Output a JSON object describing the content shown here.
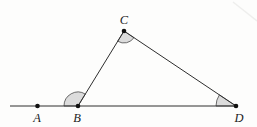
{
  "figure": {
    "background": "#fdfdfc",
    "line_color": "#2e2e2e",
    "line_width": 1,
    "wedge_fill": "#dcdcdc",
    "wedge_stroke": "#4a4a4a",
    "wedge_stroke_width": 0.8,
    "dot_color": "#111111",
    "dot_radius": 2.3,
    "label_color": "#1c1c1c",
    "points": [
      {
        "name": "A",
        "x": 37.5,
        "y": 106,
        "label": "A",
        "lx": 37,
        "ly": 122,
        "on_line": true
      },
      {
        "name": "B",
        "x": 78,
        "y": 106,
        "label": "B",
        "lx": 77,
        "ly": 122,
        "on_line": true
      },
      {
        "name": "C",
        "x": 124,
        "y": 31,
        "label": "C",
        "lx": 124,
        "ly": 24,
        "on_line": false
      },
      {
        "name": "D",
        "x": 236,
        "y": 106,
        "label": "D",
        "lx": 239,
        "ly": 122,
        "on_line": true
      }
    ],
    "base_line": {
      "x1": 10,
      "y1": 106,
      "x2": 236,
      "y2": 106
    },
    "segments": [
      {
        "from": "B",
        "to": "C"
      },
      {
        "from": "C",
        "to": "D"
      }
    ],
    "angle_marks": [
      {
        "at": "B",
        "r": 14,
        "from": 180,
        "to": 301.5,
        "note": "exterior angle ABC"
      },
      {
        "at": "C",
        "r": 12,
        "from": 33.8,
        "to": 121.5,
        "note": "interior angle BCD"
      },
      {
        "at": "D",
        "r": 20,
        "from": 180,
        "to": 213.8,
        "note": "interior angle CDB"
      }
    ],
    "corner_artifact": {
      "x1": 233,
      "y1": 2,
      "x2": 257,
      "y2": 21,
      "color": "#e9e9e7",
      "width": 1.4
    }
  }
}
